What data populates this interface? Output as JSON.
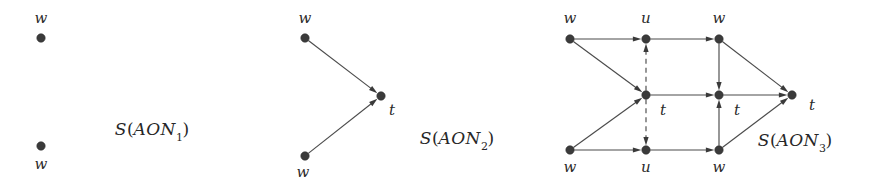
{
  "figure": {
    "width": 875,
    "height": 181,
    "background": "#ffffff",
    "ink_color": "#3b3b3b",
    "edge_color": "#4b4b4b"
  },
  "panels": [
    {
      "id": "panel-1",
      "caption": {
        "prefix": "S",
        "open": "(",
        "name": "AON",
        "subscript": "1",
        "close": ")",
        "x": 152,
        "y": 131
      },
      "nodes": [
        {
          "id": "p1-w-top",
          "label": "w",
          "x": 41,
          "y": 38,
          "label_x": 41,
          "label_y": 18
        },
        {
          "id": "p1-w-bottom",
          "label": "w",
          "x": 41,
          "y": 146,
          "label_x": 41,
          "label_y": 164
        }
      ],
      "edges": []
    },
    {
      "id": "panel-2",
      "caption": {
        "prefix": "S",
        "open": "(",
        "name": "AON",
        "subscript": "2",
        "close": ")",
        "x": 457,
        "y": 140
      },
      "nodes": [
        {
          "id": "p2-w-top",
          "label": "w",
          "x": 305,
          "y": 38,
          "label_x": 305,
          "label_y": 18
        },
        {
          "id": "p2-w-bottom",
          "label": "w",
          "x": 305,
          "y": 156,
          "label_x": 303,
          "label_y": 172
        },
        {
          "id": "p2-t",
          "label": "t",
          "x": 381,
          "y": 96,
          "label_x": 392,
          "label_y": 110
        }
      ],
      "edges": [
        {
          "from": "p2-w-top",
          "to": "p2-t",
          "style": "solid",
          "arrow": true
        },
        {
          "from": "p2-w-bottom",
          "to": "p2-t",
          "style": "solid",
          "arrow": true
        }
      ]
    },
    {
      "id": "panel-3",
      "caption": {
        "prefix": "S",
        "open": "(",
        "name": "AON",
        "subscript": "3",
        "close": ")",
        "x": 795,
        "y": 142
      },
      "nodes": [
        {
          "id": "p3-w-tl",
          "label": "w",
          "x": 570,
          "y": 39,
          "label_x": 570,
          "label_y": 18
        },
        {
          "id": "p3-u-top",
          "label": "u",
          "x": 646,
          "y": 39,
          "label_x": 646,
          "label_y": 18
        },
        {
          "id": "p3-w-tr",
          "label": "w",
          "x": 719,
          "y": 39,
          "label_x": 719,
          "label_y": 18
        },
        {
          "id": "p3-t-left",
          "label": "t",
          "x": 646,
          "y": 95,
          "label_x": 663,
          "label_y": 110
        },
        {
          "id": "p3-t-mid",
          "label": "t",
          "x": 719,
          "y": 95,
          "label_x": 737,
          "label_y": 110
        },
        {
          "id": "p3-t-right",
          "label": "t",
          "x": 792,
          "y": 95,
          "label_x": 812,
          "label_y": 105
        },
        {
          "id": "p3-w-bl",
          "label": "w",
          "x": 570,
          "y": 150,
          "label_x": 570,
          "label_y": 167
        },
        {
          "id": "p3-u-bottom",
          "label": "u",
          "x": 646,
          "y": 150,
          "label_x": 646,
          "label_y": 167
        },
        {
          "id": "p3-w-br",
          "label": "w",
          "x": 719,
          "y": 150,
          "label_x": 719,
          "label_y": 167
        }
      ],
      "edges": [
        {
          "from": "p3-w-tl",
          "to": "p3-u-top",
          "style": "solid",
          "arrow": true
        },
        {
          "from": "p3-w-tl",
          "to": "p3-t-left",
          "style": "solid",
          "arrow": true
        },
        {
          "from": "p3-u-top",
          "to": "p3-w-tr",
          "style": "solid",
          "arrow": true
        },
        {
          "from": "p3-t-left",
          "to": "p3-u-top",
          "style": "dashed",
          "arrow": true
        },
        {
          "from": "p3-t-left",
          "to": "p3-u-bottom",
          "style": "dashed",
          "arrow": true
        },
        {
          "from": "p3-t-left",
          "to": "p3-t-mid",
          "style": "solid",
          "arrow": true
        },
        {
          "from": "p3-w-tr",
          "to": "p3-t-mid",
          "style": "solid",
          "arrow": true
        },
        {
          "from": "p3-w-tr",
          "to": "p3-t-right",
          "style": "solid",
          "arrow": true
        },
        {
          "from": "p3-w-bl",
          "to": "p3-t-left",
          "style": "solid",
          "arrow": true
        },
        {
          "from": "p3-w-bl",
          "to": "p3-u-bottom",
          "style": "solid",
          "arrow": true
        },
        {
          "from": "p3-u-bottom",
          "to": "p3-w-br",
          "style": "solid",
          "arrow": true
        },
        {
          "from": "p3-w-br",
          "to": "p3-t-mid",
          "style": "solid",
          "arrow": true
        },
        {
          "from": "p3-w-br",
          "to": "p3-t-right",
          "style": "solid",
          "arrow": true
        },
        {
          "from": "p3-t-mid",
          "to": "p3-t-right",
          "style": "solid",
          "arrow": true
        }
      ]
    }
  ]
}
